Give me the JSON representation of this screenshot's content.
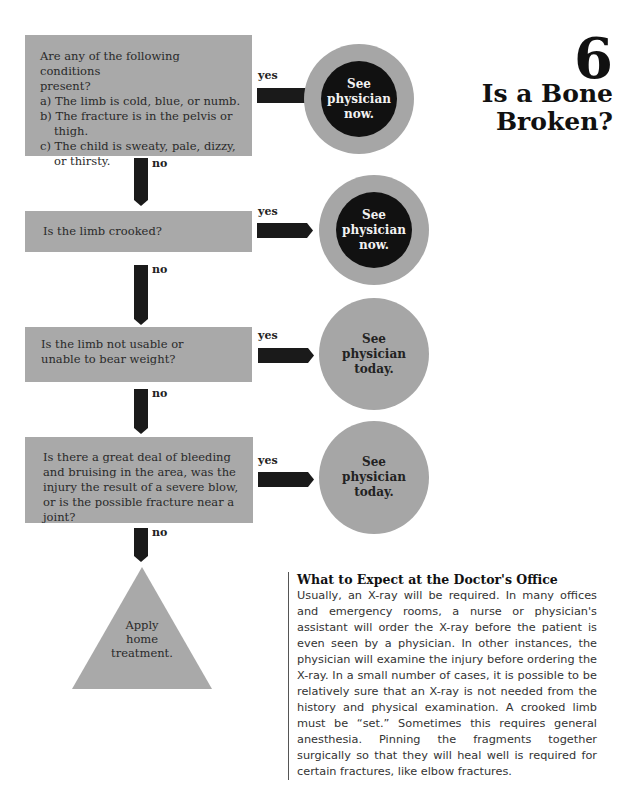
{
  "header": {
    "chapter_number": "6",
    "title_line1": "Is a Bone",
    "title_line2": "Broken?"
  },
  "flowchart": {
    "questions": [
      {
        "intro_line1": "Are any of the following conditions",
        "intro_line2": "present?",
        "items": [
          "a) The limb is cold, blue, or numb.",
          "b) The fracture is in the pelvis or thigh.",
          "c) The child is sweaty, pale, dizzy, or thirsty."
        ]
      },
      {
        "text": "Is the limb crooked?"
      },
      {
        "text": "Is the limb not usable or unable to bear weight?"
      },
      {
        "text": "Is there a great deal of bleeding and bruising in the area, was the injury the result of a severe blow, or is the possible fracture near a joint?"
      }
    ],
    "yes_label": "yes",
    "no_label": "no",
    "outcomes": [
      {
        "line1": "See",
        "line2": "physician",
        "line3": "now.",
        "style": "urgent"
      },
      {
        "line1": "See",
        "line2": "physician",
        "line3": "now.",
        "style": "urgent"
      },
      {
        "line1": "See",
        "line2": "physician",
        "line3": "today.",
        "style": "normal"
      },
      {
        "line1": "See",
        "line2": "physician",
        "line3": "today.",
        "style": "normal"
      }
    ],
    "final": {
      "line1": "Apply",
      "line2": "home",
      "line3": "treatment."
    }
  },
  "sidebar": {
    "heading": "What to Expect at the Doctor's Office",
    "body": "Usually, an X-ray will be required. In many offices and emergency rooms, a nurse or physician's assistant will order the X-ray before the patient is even seen by a physician. In other instances, the physician will examine the injury before ordering the X-ray. In a small number of cases, it is possible to be relatively sure that an X-ray is not needed from the history and physical examination. A crooked limb must be “set.” Sometimes this requires general anesthesia. Pinning the fragments together surgically so that they will heal well is required for certain fractures, like elbow fractures."
  },
  "colors": {
    "box_gray": "#a9a9a9",
    "arrow_black": "#1a1a1a",
    "urgent_inner": "#111111"
  }
}
